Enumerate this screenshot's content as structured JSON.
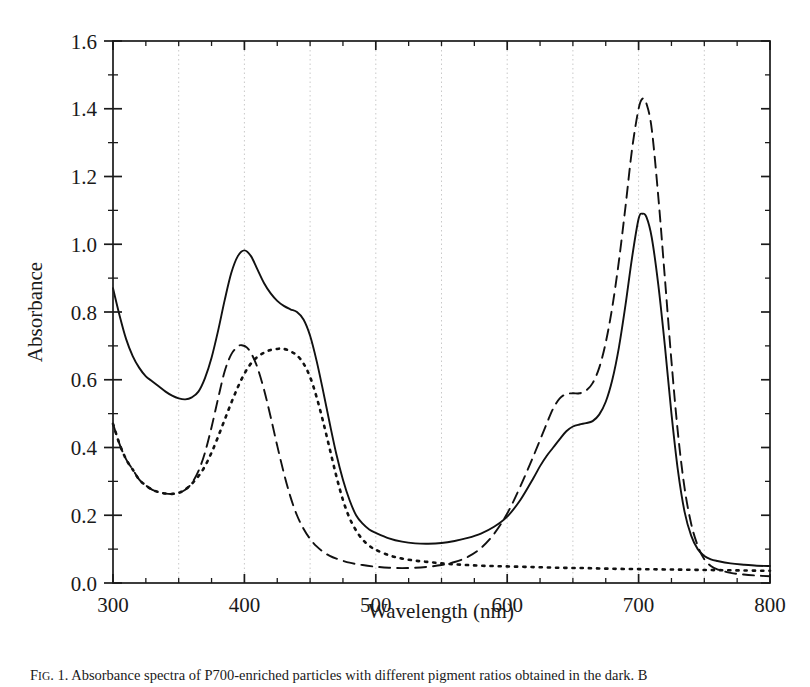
{
  "caption": {
    "prefix": "F",
    "prefix_small": "IG",
    "text": ". 1. Absorbance spectra of P700-enriched particles with different pigment ratios obtained in the dark. B"
  },
  "chart_data": {
    "type": "line",
    "title": "",
    "xlabel": "Wavelength (nm)",
    "ylabel": "Absorbance",
    "xlim": [
      300,
      800
    ],
    "ylim": [
      0.0,
      1.6
    ],
    "xticks": [
      300,
      400,
      500,
      600,
      700,
      800
    ],
    "xtick_labels": [
      "300",
      "400",
      "500",
      "600",
      "700",
      "800"
    ],
    "yticks": [
      0.0,
      0.2,
      0.4,
      0.6,
      0.8,
      1.0,
      1.2,
      1.4,
      1.6
    ],
    "ytick_labels": [
      "0.0",
      "0.2",
      "0.4",
      "0.6",
      "0.8",
      "1.0",
      "1.2",
      "1.4",
      "1.6"
    ],
    "xminor_step": 25,
    "yminor_step": 0.1,
    "grid": "vertical dotted gridlines every 50 nm from 350 to 750",
    "gridlines_x": [
      350,
      400,
      450,
      500,
      550,
      600,
      650,
      700,
      750
    ],
    "legend": "none",
    "series": [
      {
        "name": "solid",
        "style": "solid",
        "color": "#111111",
        "x": [
          300,
          305,
          310,
          315,
          320,
          325,
          330,
          335,
          340,
          345,
          350,
          355,
          360,
          365,
          370,
          375,
          380,
          385,
          390,
          395,
          400,
          405,
          410,
          415,
          420,
          425,
          430,
          435,
          440,
          445,
          450,
          455,
          460,
          465,
          470,
          475,
          480,
          485,
          490,
          495,
          500,
          510,
          520,
          530,
          540,
          550,
          560,
          570,
          580,
          590,
          600,
          610,
          620,
          625,
          630,
          635,
          640,
          645,
          650,
          655,
          660,
          665,
          670,
          675,
          680,
          685,
          690,
          695,
          700,
          703,
          706,
          710,
          715,
          720,
          725,
          730,
          735,
          740,
          745,
          750,
          755,
          760,
          770,
          780,
          790,
          800
        ],
        "y": [
          0.87,
          0.79,
          0.72,
          0.67,
          0.635,
          0.61,
          0.595,
          0.58,
          0.565,
          0.553,
          0.545,
          0.542,
          0.548,
          0.565,
          0.605,
          0.665,
          0.745,
          0.835,
          0.915,
          0.965,
          0.982,
          0.965,
          0.925,
          0.885,
          0.855,
          0.833,
          0.818,
          0.808,
          0.8,
          0.778,
          0.73,
          0.655,
          0.565,
          0.47,
          0.38,
          0.305,
          0.245,
          0.2,
          0.175,
          0.158,
          0.148,
          0.132,
          0.122,
          0.117,
          0.116,
          0.118,
          0.124,
          0.133,
          0.146,
          0.166,
          0.196,
          0.245,
          0.31,
          0.345,
          0.375,
          0.4,
          0.425,
          0.448,
          0.462,
          0.468,
          0.472,
          0.478,
          0.497,
          0.535,
          0.6,
          0.695,
          0.82,
          0.96,
          1.075,
          1.09,
          1.08,
          1.02,
          0.88,
          0.7,
          0.5,
          0.33,
          0.21,
          0.14,
          0.1,
          0.08,
          0.07,
          0.065,
          0.058,
          0.054,
          0.051,
          0.05
        ]
      },
      {
        "name": "dashed",
        "style": "dashed",
        "color": "#111111",
        "x": [
          300,
          305,
          310,
          315,
          320,
          325,
          330,
          335,
          340,
          345,
          350,
          355,
          360,
          365,
          370,
          375,
          380,
          385,
          390,
          395,
          398,
          402,
          406,
          410,
          415,
          420,
          425,
          430,
          435,
          440,
          445,
          450,
          455,
          460,
          465,
          470,
          480,
          490,
          500,
          510,
          520,
          530,
          540,
          550,
          560,
          570,
          580,
          590,
          600,
          610,
          620,
          630,
          635,
          640,
          645,
          650,
          655,
          660,
          665,
          670,
          675,
          680,
          685,
          690,
          695,
          700,
          703,
          706,
          710,
          715,
          720,
          725,
          730,
          735,
          740,
          745,
          750,
          755,
          760,
          770,
          780,
          790,
          800
        ],
        "y": [
          0.47,
          0.41,
          0.365,
          0.335,
          0.305,
          0.288,
          0.275,
          0.268,
          0.264,
          0.263,
          0.266,
          0.275,
          0.295,
          0.33,
          0.385,
          0.46,
          0.545,
          0.625,
          0.675,
          0.698,
          0.702,
          0.695,
          0.672,
          0.635,
          0.57,
          0.49,
          0.405,
          0.325,
          0.255,
          0.2,
          0.16,
          0.13,
          0.108,
          0.092,
          0.08,
          0.072,
          0.06,
          0.053,
          0.048,
          0.045,
          0.044,
          0.045,
          0.048,
          0.053,
          0.062,
          0.077,
          0.103,
          0.145,
          0.205,
          0.285,
          0.375,
          0.47,
          0.515,
          0.545,
          0.558,
          0.56,
          0.56,
          0.568,
          0.59,
          0.635,
          0.71,
          0.815,
          0.95,
          1.11,
          1.28,
          1.4,
          1.43,
          1.415,
          1.34,
          1.14,
          0.9,
          0.655,
          0.44,
          0.28,
          0.175,
          0.11,
          0.07,
          0.05,
          0.04,
          0.03,
          0.025,
          0.022,
          0.02
        ]
      },
      {
        "name": "dotted",
        "style": "dotted",
        "color": "#111111",
        "x": [
          300,
          305,
          310,
          315,
          320,
          325,
          330,
          335,
          340,
          345,
          350,
          355,
          360,
          365,
          370,
          375,
          380,
          385,
          390,
          395,
          400,
          405,
          410,
          415,
          420,
          425,
          428,
          432,
          436,
          440,
          445,
          450,
          455,
          460,
          465,
          470,
          475,
          480,
          485,
          490,
          495,
          500,
          510,
          520,
          530,
          540,
          550,
          560,
          570,
          580,
          590,
          600,
          620,
          640,
          660,
          680,
          700,
          720,
          740,
          760,
          780,
          800
        ],
        "y": [
          0.47,
          0.41,
          0.365,
          0.335,
          0.305,
          0.288,
          0.275,
          0.268,
          0.264,
          0.263,
          0.266,
          0.276,
          0.293,
          0.315,
          0.345,
          0.385,
          0.432,
          0.482,
          0.532,
          0.578,
          0.618,
          0.648,
          0.668,
          0.68,
          0.688,
          0.691,
          0.692,
          0.689,
          0.682,
          0.672,
          0.648,
          0.608,
          0.548,
          0.475,
          0.395,
          0.315,
          0.245,
          0.192,
          0.155,
          0.128,
          0.11,
          0.098,
          0.082,
          0.072,
          0.066,
          0.062,
          0.058,
          0.055,
          0.053,
          0.051,
          0.05,
          0.049,
          0.047,
          0.045,
          0.044,
          0.042,
          0.041,
          0.04,
          0.039,
          0.038,
          0.037,
          0.036
        ]
      }
    ]
  }
}
